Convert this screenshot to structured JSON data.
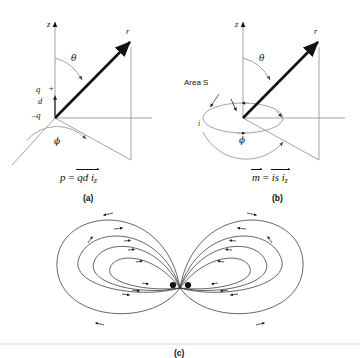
{
  "figure": {
    "background": "#ffffff",
    "ink_dark": "#111111",
    "ink_gray": "#999999",
    "ink_light": "#bbbbbb"
  },
  "panels": [
    {
      "id": "a",
      "tag": "(a)",
      "caption_formula": {
        "lhs": "p",
        "eq": "=",
        "rhs_main": "qd i",
        "rhs_sub": "z"
      },
      "axes": {
        "z": "z"
      },
      "vectors": {
        "r": "r"
      },
      "angles": {
        "theta": "θ",
        "phi": "ϕ"
      },
      "charges": {
        "upper_symbol": "q",
        "upper_sign": "+",
        "separation": "d",
        "lower_symbol": "–q"
      }
    },
    {
      "id": "b",
      "tag": "(b)",
      "caption_formula": {
        "lhs": "m",
        "eq": "=",
        "rhs_main": "is i",
        "rhs_sub": "z"
      },
      "axes": {
        "z": "z"
      },
      "vectors": {
        "r": "r"
      },
      "angles": {
        "theta": "θ",
        "phi": "ϕ"
      },
      "loop": {
        "area_label": "Area S",
        "current_label": "i"
      }
    },
    {
      "id": "c",
      "tag": "(c)",
      "description": "Dipole field lines: nested closed loops on both sides of two central poles",
      "poles": 2,
      "loops_per_side": 4
    }
  ]
}
